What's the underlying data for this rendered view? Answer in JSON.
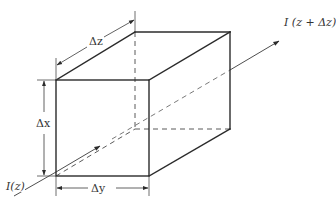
{
  "figure": {
    "type": "isometric rectangular volume element",
    "labels": {
      "dz": "Δz",
      "dx": "Δx",
      "dy": "Δy",
      "current_in": "I(z)",
      "current_out": "I (z + Δz)"
    },
    "colors": {
      "line": "#2b2b2b",
      "hidden_line": "#5a5a5a",
      "background": "#ffffff"
    }
  }
}
